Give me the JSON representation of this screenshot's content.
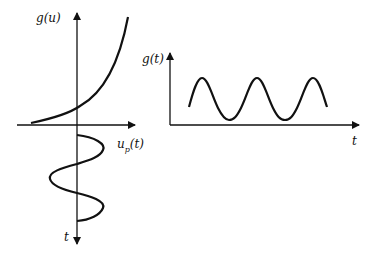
{
  "diagram": {
    "left_panel": {
      "vertical_axis_top_label": "g(u)",
      "horizontal_axis_label_base": "u",
      "horizontal_axis_label_sub": "p",
      "horizontal_axis_label_arg": "(t)",
      "vertical_axis_bottom_label": "t",
      "curves": [
        "exponential g(u)",
        "sinusoidal input u_p(t) plotted downward in t"
      ]
    },
    "right_panel": {
      "vertical_axis_label": "g(t)",
      "horizontal_axis_label": "t",
      "curves": [
        "periodic output g(t) with sharper peaks than troughs"
      ]
    },
    "colors": {
      "stroke": "#111111",
      "background": "#ffffff"
    }
  }
}
